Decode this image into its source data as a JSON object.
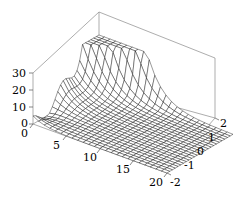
{
  "plot": {
    "kind": "3d-surface-wireframe",
    "background_color": "#ffffff",
    "line_color": "#000000",
    "box_color": "#888888"
  },
  "axes": {
    "x": {
      "label": "",
      "range": [
        0,
        20
      ],
      "ticks": [
        {
          "value": 0,
          "text": "0"
        },
        {
          "value": 5,
          "text": "5"
        },
        {
          "value": 10,
          "text": "10"
        },
        {
          "value": 15,
          "text": "15"
        },
        {
          "value": 20,
          "text": "20"
        }
      ]
    },
    "y": {
      "label": "",
      "range": [
        -2,
        2
      ],
      "ticks": [
        {
          "value": -2,
          "text": "-2"
        },
        {
          "value": -1,
          "text": "-1"
        },
        {
          "value": 0,
          "text": "0"
        },
        {
          "value": 1,
          "text": "1"
        },
        {
          "value": 2,
          "text": "2"
        }
      ]
    },
    "z": {
      "label": "",
      "range": [
        0,
        30
      ],
      "ticks": [
        {
          "value": 0,
          "text": "0"
        },
        {
          "value": 10,
          "text": "10"
        },
        {
          "value": 20,
          "text": "20"
        },
        {
          "value": 30,
          "text": "30"
        }
      ]
    }
  },
  "chart_data": {
    "type": "surface",
    "title": "",
    "xlabel": "",
    "ylabel": "",
    "zlabel": "",
    "xlim": [
      0,
      20
    ],
    "ylim": [
      -2,
      2
    ],
    "zlim": [
      0,
      30
    ],
    "grid": false,
    "legend": "none",
    "mesh": {
      "nx": 25,
      "ny": 25,
      "style": "wireframe-black-on-white"
    },
    "x_samples": [
      0,
      0.83,
      1.67,
      2.5,
      3.33,
      4.17,
      5,
      5.83,
      6.67,
      7.5,
      8.33,
      9.17,
      10,
      10.83,
      11.67,
      12.5,
      13.33,
      14.17,
      15,
      15.83,
      16.67,
      17.5,
      18.33,
      19.17,
      20
    ],
    "y_samples": [
      -2,
      -1.83,
      -1.67,
      -1.5,
      -1.33,
      -1.17,
      -1,
      -0.83,
      -0.67,
      -0.5,
      -0.33,
      -0.17,
      0,
      0.17,
      0.33,
      0.5,
      0.67,
      0.83,
      1,
      1.17,
      1.33,
      1.5,
      1.67,
      1.83,
      2
    ],
    "z_surface_note": "z = 30 * exp(-x/2.2) / (0.04 + (y-2)^2*0.9) clipped to [0,30], plus small ripple term near x<4"
  }
}
